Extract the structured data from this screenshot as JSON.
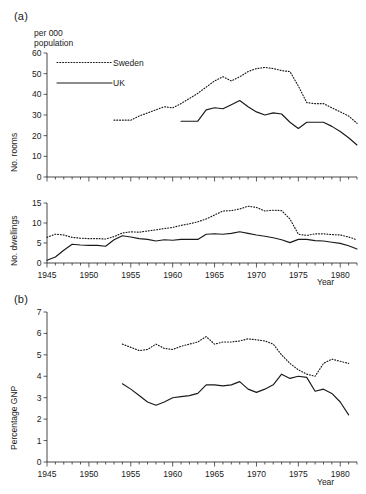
{
  "figure": {
    "panel_a_label": "(a)",
    "panel_b_label": "(b)",
    "units_note": "per 000\npopulation",
    "year_axis_label": "Year"
  },
  "legend": {
    "sweden": "Sweden",
    "uk": "UK",
    "sweden_style": "dotted",
    "uk_style": "solid",
    "color": "#1a1a1a"
  },
  "chart_data": [
    {
      "id": "rooms",
      "type": "line",
      "title": "(a)",
      "xlabel": "Year",
      "ylabel": "No. rooms",
      "unit_note": "per 000 population",
      "xlim": [
        1945,
        1982
      ],
      "ylim": [
        0,
        60
      ],
      "xticks": [
        1945,
        1950,
        1955,
        1960,
        1965,
        1970,
        1975,
        1980
      ],
      "yticks": [
        0,
        10,
        20,
        30,
        40,
        50,
        60
      ],
      "grid": false,
      "legend_position": "top-left",
      "series": [
        {
          "name": "Sweden",
          "style": "dotted",
          "x": [
            1953,
            1954,
            1955,
            1956,
            1957,
            1958,
            1959,
            1960,
            1961,
            1962,
            1963,
            1964,
            1965,
            1966,
            1967,
            1968,
            1969,
            1970,
            1971,
            1972,
            1973,
            1974,
            1975,
            1976,
            1977,
            1978,
            1979,
            1980,
            1981,
            1982
          ],
          "values": [
            27.5,
            27.5,
            27.5,
            29.5,
            31.0,
            32.5,
            34.0,
            33.5,
            35.5,
            38.0,
            40.5,
            43.5,
            46.5,
            48.5,
            46.5,
            48.5,
            51.0,
            52.5,
            53.0,
            52.5,
            51.5,
            51.0,
            44.0,
            36.0,
            35.5,
            35.5,
            33.5,
            31.5,
            29.5,
            26.0
          ]
        },
        {
          "name": "UK",
          "style": "solid",
          "x": [
            1961,
            1962,
            1963,
            1964,
            1965,
            1966,
            1967,
            1968,
            1969,
            1970,
            1971,
            1972,
            1973,
            1974,
            1975,
            1976,
            1977,
            1978,
            1979,
            1980,
            1981,
            1982
          ],
          "values": [
            27.0,
            27.0,
            27.0,
            32.5,
            33.5,
            33.0,
            35.0,
            37.0,
            34.0,
            31.5,
            30.0,
            31.0,
            30.5,
            26.5,
            23.5,
            26.5,
            26.5,
            26.5,
            24.5,
            22.0,
            19.0,
            15.5
          ]
        }
      ]
    },
    {
      "id": "dwellings",
      "type": "line",
      "xlabel": "Year",
      "ylabel": "No. dwellings",
      "unit_note": "per 000 population",
      "xlim": [
        1945,
        1982
      ],
      "ylim": [
        0,
        15
      ],
      "xticks": [
        1945,
        1950,
        1955,
        1960,
        1965,
        1970,
        1975,
        1980
      ],
      "yticks": [
        0,
        5,
        10,
        15
      ],
      "grid": false,
      "series": [
        {
          "name": "Sweden",
          "style": "dotted",
          "x": [
            1945,
            1946,
            1947,
            1948,
            1949,
            1950,
            1951,
            1952,
            1953,
            1954,
            1955,
            1956,
            1957,
            1958,
            1959,
            1960,
            1961,
            1962,
            1963,
            1964,
            1965,
            1966,
            1967,
            1968,
            1969,
            1970,
            1971,
            1972,
            1973,
            1974,
            1975,
            1976,
            1977,
            1978,
            1979,
            1980,
            1981,
            1982
          ],
          "values": [
            6.4,
            7.2,
            7.0,
            6.4,
            6.2,
            6.1,
            6.1,
            6.0,
            6.6,
            7.5,
            7.8,
            7.7,
            8.0,
            8.3,
            8.6,
            8.9,
            9.4,
            9.8,
            10.3,
            11.0,
            12.0,
            13.0,
            13.1,
            13.5,
            14.2,
            13.9,
            13.0,
            13.2,
            13.1,
            11.0,
            7.2,
            6.9,
            7.3,
            7.3,
            7.1,
            7.0,
            6.5,
            5.8
          ]
        },
        {
          "name": "UK",
          "style": "solid",
          "x": [
            1945,
            1946,
            1947,
            1948,
            1949,
            1950,
            1951,
            1952,
            1953,
            1954,
            1955,
            1956,
            1957,
            1958,
            1959,
            1960,
            1961,
            1962,
            1963,
            1964,
            1965,
            1966,
            1967,
            1968,
            1969,
            1970,
            1971,
            1972,
            1973,
            1974,
            1975,
            1976,
            1977,
            1978,
            1979,
            1980,
            1981,
            1982
          ],
          "values": [
            0.7,
            1.5,
            3.2,
            4.7,
            4.5,
            4.4,
            4.4,
            4.2,
            5.8,
            6.8,
            6.5,
            6.1,
            5.9,
            5.5,
            5.8,
            5.7,
            5.9,
            5.9,
            5.9,
            7.2,
            7.3,
            7.2,
            7.4,
            7.8,
            7.4,
            7.0,
            6.7,
            6.3,
            5.8,
            5.1,
            5.9,
            5.9,
            5.6,
            5.5,
            5.2,
            4.9,
            4.3,
            3.5
          ]
        }
      ]
    },
    {
      "id": "gnp",
      "type": "line",
      "title": "(b)",
      "xlabel": "Year",
      "ylabel": "Percentage GNP",
      "xlim": [
        1945,
        1982
      ],
      "ylim": [
        0,
        7
      ],
      "xticks": [
        1945,
        1950,
        1955,
        1960,
        1965,
        1970,
        1975,
        1980
      ],
      "yticks": [
        0,
        1,
        2,
        3,
        4,
        5,
        6,
        7
      ],
      "grid": false,
      "series": [
        {
          "name": "Sweden",
          "style": "dotted",
          "x": [
            1954,
            1955,
            1956,
            1957,
            1958,
            1959,
            1960,
            1961,
            1962,
            1963,
            1964,
            1965,
            1966,
            1967,
            1968,
            1969,
            1970,
            1971,
            1972,
            1973,
            1974,
            1975,
            1976,
            1977,
            1978,
            1979,
            1980,
            1981
          ],
          "values": [
            5.5,
            5.35,
            5.2,
            5.25,
            5.5,
            5.3,
            5.25,
            5.4,
            5.5,
            5.6,
            5.85,
            5.5,
            5.6,
            5.6,
            5.65,
            5.75,
            5.7,
            5.65,
            5.5,
            5.0,
            4.6,
            4.3,
            4.1,
            4.0,
            4.6,
            4.8,
            4.7,
            4.6
          ]
        },
        {
          "name": "UK",
          "style": "solid",
          "x": [
            1954,
            1955,
            1956,
            1957,
            1958,
            1959,
            1960,
            1961,
            1962,
            1963,
            1964,
            1965,
            1966,
            1967,
            1968,
            1969,
            1970,
            1971,
            1972,
            1973,
            1974,
            1975,
            1976,
            1977,
            1978,
            1979,
            1980,
            1981
          ],
          "values": [
            3.65,
            3.4,
            3.1,
            2.8,
            2.65,
            2.8,
            3.0,
            3.05,
            3.1,
            3.2,
            3.6,
            3.6,
            3.55,
            3.6,
            3.75,
            3.4,
            3.25,
            3.4,
            3.6,
            4.1,
            3.9,
            4.0,
            3.95,
            3.3,
            3.4,
            3.2,
            2.8,
            2.2
          ]
        }
      ]
    }
  ]
}
